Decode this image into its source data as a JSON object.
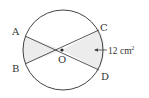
{
  "diagram": {
    "type": "circle-geometry",
    "colors": {
      "stroke": "#444444",
      "shade": "#ececec",
      "text": "#333333"
    },
    "center": {
      "label": "O"
    },
    "points": [
      {
        "label": "A"
      },
      {
        "label": "B"
      },
      {
        "label": "C"
      },
      {
        "label": "D"
      }
    ],
    "annotation": {
      "value": "12",
      "unit": "cm",
      "exponent": "2"
    }
  }
}
